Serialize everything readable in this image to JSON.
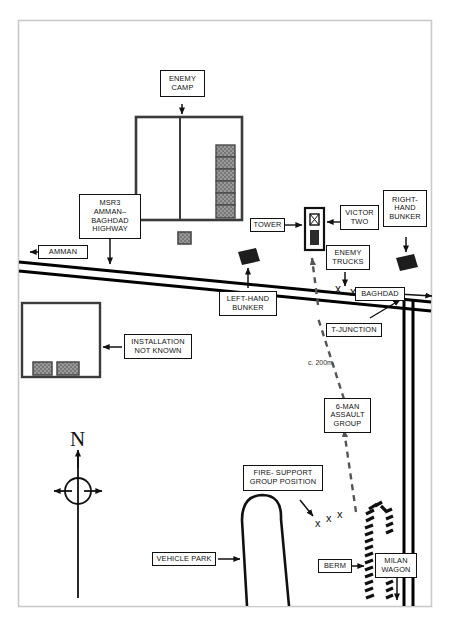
{
  "diagram": {
    "orientation_letter": "N",
    "colors": {
      "ink": "#111111",
      "border": "#c9c9c9",
      "hatch_fill": "#8c8c8c",
      "road": "#000000",
      "annotation_grey": "#444444"
    }
  },
  "labels": {
    "enemy_camp": "ENEMY\nCAMP",
    "msr3": "MSR3\nAMMAN–\nBAGHDAD\nHIGHWAY",
    "amman": "AMMAN",
    "baghdad": "BAGHDAD",
    "tower": "TOWER",
    "victor_two": "VICTOR\nTWO",
    "right_hand_bunker": "RIGHT-\nHAND\nBUNKER",
    "enemy_trucks": "ENEMY\nTRUCKS",
    "left_hand_bunker": "LEFT-HAND\nBUNKER",
    "installation_not_known": "INSTALLATION\nNOT KNOWN",
    "t_junction": "T-JUNCTION",
    "assault_group": "6-MAN\nASSAULT\nGROUP",
    "fire_support": "FIRE- SUPPORT\nGROUP POSITION",
    "vehicle_park": "VEHICLE PARK",
    "berm": "BERM",
    "milan_wagon": "MILAN\nWAGON",
    "distance_note": "c. 200m"
  },
  "map_features": {
    "roads": [
      {
        "name": "msr3-highway",
        "type": "double-line",
        "label": "MSR3 Amman-Baghdad Highway",
        "direction_west": "AMMAN",
        "direction_east": "BAGHDAD"
      },
      {
        "name": "t-junction-road",
        "type": "double-line",
        "label": "T-Junction road running south"
      }
    ],
    "structures": [
      {
        "name": "enemy-camp-compound",
        "cells": 6,
        "divider": true
      },
      {
        "name": "installation-not-known",
        "units": 2
      },
      {
        "name": "watchtower",
        "marker": "crossed-square"
      },
      {
        "name": "vehicle-park",
        "shape": "rounded-elongated"
      },
      {
        "name": "berm",
        "shape": "hatched-barrier"
      }
    ],
    "units": [
      {
        "name": "left-hand-bunker",
        "symbol": "filled-quadrilateral"
      },
      {
        "name": "right-hand-bunker",
        "symbol": "filled-quadrilateral"
      },
      {
        "name": "enemy-trucks",
        "symbol": "x-marks",
        "count": 2
      },
      {
        "name": "fire-support-group",
        "symbol": "x-marks",
        "count": 3
      }
    ],
    "movement": {
      "name": "assault-route",
      "style": "dashed",
      "from": "fire-support-group-position",
      "to": "watchtower",
      "distance": "c. 200m"
    }
  }
}
